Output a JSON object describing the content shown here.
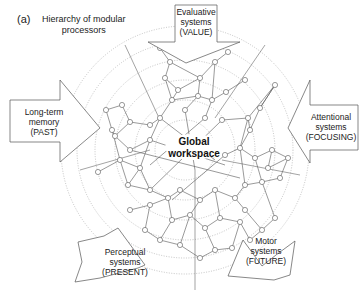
{
  "figure": {
    "panel_label": "(a)",
    "title_line1": "Hierarchy of modular",
    "title_line2": "processors",
    "center_label_line1": "Global",
    "center_label_line2": "workspace"
  },
  "systems": [
    {
      "id": "value",
      "line1": "Evaluative",
      "line2": "systems",
      "line3": "(VALUE)",
      "direction": "top"
    },
    {
      "id": "past",
      "line1": "Long-term",
      "line2": "memory",
      "line3": "(PAST)",
      "direction": "left"
    },
    {
      "id": "focusing",
      "line1": "Attentional",
      "line2": "systems",
      "line3": "(FOCUSING)",
      "direction": "right"
    },
    {
      "id": "present",
      "line1": "Perceptual",
      "line2": "systems",
      "line3": "(PRESENT)",
      "direction": "bottom-left"
    },
    {
      "id": "future",
      "line1": "Motor",
      "line2": "systems",
      "line3": "(FUTURE)",
      "direction": "bottom-right"
    }
  ],
  "colors": {
    "line": "#555555",
    "dotted_ring": "#aaaaaa",
    "node_fill": "#ffffff",
    "text": "#222222"
  },
  "rings": {
    "center": [
      185,
      150
    ],
    "radii": [
      28,
      48,
      68,
      88,
      108,
      124
    ]
  }
}
